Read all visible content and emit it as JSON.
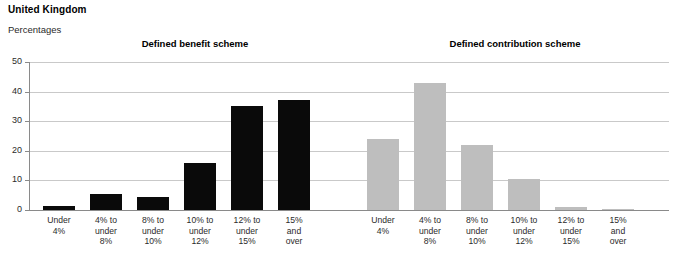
{
  "header": {
    "country_title": "United Kingdom",
    "unit_label": "Percentages"
  },
  "panels": {
    "left_title": "Defined benefit scheme",
    "right_title": "Defined contribution scheme"
  },
  "axis": {
    "yticks": [
      "0",
      "10",
      "20",
      "30",
      "40",
      "50"
    ]
  },
  "colors": {
    "dark_bar": "#0a0a0a",
    "light_bar": "#bebebe",
    "gridline": "#c9c9c9",
    "axis": "#8a8a8a"
  },
  "categories": [
    "Under\n4%",
    "4% to\nunder\n8%",
    "8% to\nunder\n10%",
    "10% to\nunder\n12%",
    "12% to\nunder\n15%",
    "15%\nand\nover"
  ],
  "chart_data": {
    "type": "bar",
    "title": "United Kingdom",
    "subtitle": "Percentages",
    "xlabel": "",
    "ylabel": "Percentages",
    "ylim": [
      0,
      50
    ],
    "yticks": [
      0,
      10,
      20,
      30,
      40,
      50
    ],
    "grid": true,
    "legend": "none",
    "panels": [
      {
        "name": "Defined benefit scheme",
        "color": "#0a0a0a",
        "categories": [
          "Under 4%",
          "4% to under 8%",
          "8% to under 10%",
          "10% to under 12%",
          "12% to under 15%",
          "15% and over"
        ],
        "values": [
          1.5,
          5.5,
          4.5,
          16,
          35,
          37
        ]
      },
      {
        "name": "Defined contribution scheme",
        "color": "#bebebe",
        "categories": [
          "Under 4%",
          "4% to under 8%",
          "8% to under 10%",
          "10% to under 12%",
          "12% to under 15%",
          "15% and over"
        ],
        "values": [
          24,
          43,
          22,
          10.5,
          1,
          0.5
        ]
      }
    ]
  },
  "layout": {
    "left_bars": [
      {
        "x": 14,
        "w": 32,
        "v": 1.5
      },
      {
        "x": 61,
        "w": 32,
        "v": 5.5
      },
      {
        "x": 108,
        "w": 32,
        "v": 4.5
      },
      {
        "x": 155,
        "w": 32,
        "v": 16
      },
      {
        "x": 202,
        "w": 32,
        "v": 35
      },
      {
        "x": 249,
        "w": 32,
        "v": 37
      }
    ],
    "right_bars": [
      {
        "x": 338,
        "w": 32,
        "v": 24
      },
      {
        "x": 385,
        "w": 32,
        "v": 43
      },
      {
        "x": 432,
        "w": 32,
        "v": 22
      },
      {
        "x": 479,
        "w": 32,
        "v": 10.5
      },
      {
        "x": 526,
        "w": 32,
        "v": 1
      },
      {
        "x": 573,
        "w": 32,
        "v": 0.5
      }
    ]
  }
}
